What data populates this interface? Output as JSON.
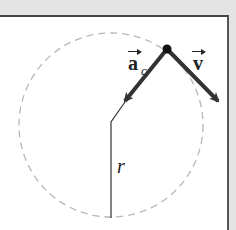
{
  "diagram": {
    "title": "",
    "labels": {
      "acceleration": "a",
      "acceleration_subscript": "c",
      "velocity": "v",
      "radius": "r"
    },
    "colors": {
      "background_band": "#e4e4e4",
      "panel": "#ffffff",
      "border": "#444444",
      "arrows": "#333333",
      "circle_dash": "#b8b8b8",
      "radius_line": "#333333"
    },
    "geometry": {
      "circle": {
        "cx": 111,
        "cy": 125,
        "r": 92,
        "style": "dashed"
      },
      "particle": {
        "x": 167,
        "y": 49,
        "r": 4
      },
      "acceleration_vector": {
        "from": [
          167,
          49
        ],
        "to": [
          125,
          101
        ],
        "direction": "toward center"
      },
      "velocity_vector": {
        "from": [
          167,
          49
        ],
        "to": [
          218,
          101
        ],
        "direction": "tangent"
      },
      "radius_line": {
        "points": [
          [
            125,
            101
          ],
          [
            111,
            122
          ],
          [
            111,
            218
          ]
        ]
      }
    }
  }
}
